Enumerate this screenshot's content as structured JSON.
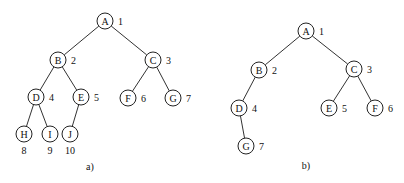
{
  "diagrams": [
    {
      "id": "a",
      "caption": "a)",
      "caption_pos": [
        90,
        166
      ],
      "nodes": [
        {
          "id": "A",
          "label": "A",
          "number": "1",
          "x": 105,
          "y": 21,
          "num_pos": "right"
        },
        {
          "id": "B",
          "label": "B",
          "number": "2",
          "x": 58,
          "y": 60,
          "num_pos": "right"
        },
        {
          "id": "C",
          "label": "C",
          "number": "3",
          "x": 153,
          "y": 60,
          "num_pos": "right"
        },
        {
          "id": "D",
          "label": "D",
          "number": "4",
          "x": 36,
          "y": 97,
          "num_pos": "right"
        },
        {
          "id": "E",
          "label": "E",
          "number": "5",
          "x": 81,
          "y": 97,
          "num_pos": "right"
        },
        {
          "id": "F",
          "label": "F",
          "number": "6",
          "x": 128,
          "y": 98,
          "num_pos": "right"
        },
        {
          "id": "G",
          "label": "G",
          "number": "7",
          "x": 173,
          "y": 98,
          "num_pos": "right"
        },
        {
          "id": "H",
          "label": "H",
          "number": "8",
          "x": 24,
          "y": 134,
          "num_pos": "below"
        },
        {
          "id": "I",
          "label": "I",
          "number": "9",
          "x": 50,
          "y": 134,
          "num_pos": "below"
        },
        {
          "id": "J",
          "label": "J",
          "number": "10",
          "x": 70,
          "y": 134,
          "num_pos": "below"
        }
      ],
      "edges": [
        [
          "A",
          "B"
        ],
        [
          "A",
          "C"
        ],
        [
          "B",
          "D"
        ],
        [
          "B",
          "E"
        ],
        [
          "C",
          "F"
        ],
        [
          "C",
          "G"
        ],
        [
          "D",
          "H"
        ],
        [
          "D",
          "I"
        ],
        [
          "E",
          "J"
        ]
      ]
    },
    {
      "id": "b",
      "caption": "b)",
      "caption_pos": [
        306,
        165
      ],
      "nodes": [
        {
          "id": "A",
          "label": "A",
          "number": "1",
          "x": 306,
          "y": 31,
          "num_pos": "right"
        },
        {
          "id": "B",
          "label": "B",
          "number": "2",
          "x": 259,
          "y": 70,
          "num_pos": "right"
        },
        {
          "id": "C",
          "label": "C",
          "number": "3",
          "x": 354,
          "y": 69,
          "num_pos": "right"
        },
        {
          "id": "D",
          "label": "D",
          "number": "4",
          "x": 239,
          "y": 108,
          "num_pos": "right"
        },
        {
          "id": "E",
          "label": "E",
          "number": "5",
          "x": 329,
          "y": 108,
          "num_pos": "right"
        },
        {
          "id": "F",
          "label": "F",
          "number": "6",
          "x": 375,
          "y": 108,
          "num_pos": "right"
        },
        {
          "id": "G",
          "label": "G",
          "number": "7",
          "x": 246,
          "y": 146,
          "num_pos": "right"
        }
      ],
      "edges": [
        [
          "A",
          "B"
        ],
        [
          "A",
          "C"
        ],
        [
          "B",
          "D"
        ],
        [
          "C",
          "E"
        ],
        [
          "C",
          "F"
        ],
        [
          "D",
          "G"
        ]
      ]
    }
  ],
  "style": {
    "node_radius": 8,
    "stroke_color": "#222222",
    "background": "#ffffff"
  }
}
